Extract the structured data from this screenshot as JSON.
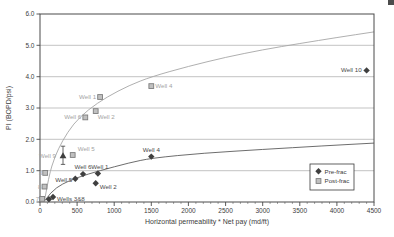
{
  "page": {
    "background": "#ffffff"
  },
  "chart_data": {
    "type": "scatter",
    "title": "",
    "xlabel": "Horizontal permeability * Net pay (md/ft)",
    "ylabel": "PI (BOPD/psi)",
    "xlim": [
      0,
      4500
    ],
    "ylim": [
      0,
      6
    ],
    "grid": "horizontal",
    "xticks": {
      "values": [
        0,
        500,
        1000,
        1500,
        2000,
        2500,
        3000,
        3500,
        4000,
        4500
      ],
      "labels": [
        "0",
        "500",
        "1000",
        "1500",
        "2000",
        "2500",
        "3000",
        "3500",
        "4000",
        "4500"
      ],
      "minor_step": 100
    },
    "yticks": {
      "values": [
        0,
        1,
        2,
        3,
        4,
        5,
        6
      ],
      "labels": [
        "0.0",
        "1.0",
        "2.0",
        "3.0",
        "4.0",
        "5.0",
        "6.0"
      ]
    },
    "colors": {
      "pre_marker": "#3f3f3f",
      "post_fill": "#c0c0c0",
      "post_stroke": "#7d7d7d",
      "trend_pre": "#5c5c5c",
      "trend_post": "#a6a6a6",
      "grid": "#9a9a9a",
      "axis": "#4a4a4a",
      "label_pre": "#4a4a4a",
      "label_post": "#a3a3a3",
      "tick_text": "#3d3d3d"
    },
    "legend": {
      "position": "lower-right",
      "items": [
        {
          "label": "Pre-frac",
          "marker": "diamond"
        },
        {
          "label": "Post-frac",
          "marker": "square"
        }
      ]
    },
    "series": [
      {
        "name": "Pre-frac",
        "marker": "diamond",
        "points": [
          {
            "x": 120,
            "y": 0.09,
            "label": "",
            "anchor": "start",
            "dx": 4,
            "dy": 3
          },
          {
            "x": 175,
            "y": 0.16,
            "label": "Wells 3&8",
            "anchor": "start",
            "dx": 4,
            "dy": 4
          },
          {
            "x": 475,
            "y": 0.74,
            "label": "Well 5",
            "anchor": "end",
            "dx": -3,
            "dy": 3
          },
          {
            "x": 580,
            "y": 0.89,
            "label": "Well 6",
            "anchor": "middle",
            "dx": 0,
            "dy": -5
          },
          {
            "x": 780,
            "y": 0.91,
            "label": "Well 1",
            "anchor": "middle",
            "dx": 2,
            "dy": -5
          },
          {
            "x": 750,
            "y": 0.6,
            "label": "Well 2",
            "anchor": "start",
            "dx": 4,
            "dy": 6
          },
          {
            "x": 1500,
            "y": 1.45,
            "label": "Well 4",
            "anchor": "middle",
            "dx": 0,
            "dy": -5
          },
          {
            "x": 4400,
            "y": 4.2,
            "label": "Well 10",
            "anchor": "end",
            "dx": -5,
            "dy": 2
          }
        ]
      },
      {
        "name": "Post-frac",
        "marker": "square",
        "points": [
          {
            "x": 30,
            "y": 0.1,
            "label": "7",
            "anchor": "end",
            "dx": -3,
            "dy": 2
          },
          {
            "x": 60,
            "y": 0.49,
            "label": "8",
            "anchor": "end",
            "dx": -3,
            "dy": 2
          },
          {
            "x": 70,
            "y": 0.93,
            "label": "3",
            "anchor": "end",
            "dx": -3,
            "dy": 2
          },
          {
            "x": 440,
            "y": 1.5,
            "label": "Well 5",
            "anchor": "start",
            "dx": 5,
            "dy": -4
          },
          {
            "x": 610,
            "y": 2.7,
            "label": "Well 6",
            "anchor": "end",
            "dx": -4,
            "dy": 2
          },
          {
            "x": 750,
            "y": 2.9,
            "label": "Well 2",
            "anchor": "start",
            "dx": 2,
            "dy": 8
          },
          {
            "x": 810,
            "y": 3.35,
            "label": "Well 1",
            "anchor": "end",
            "dx": -4,
            "dy": 2
          },
          {
            "x": 1500,
            "y": 3.7,
            "label": "Well 4",
            "anchor": "start",
            "dx": 4,
            "dy": 2
          }
        ]
      }
    ],
    "error_point": {
      "label": "Well 9",
      "x": 310,
      "y": 1.48,
      "y_lo": 1.2,
      "y_hi": 1.78,
      "marker": "triangle",
      "anchor": "end",
      "dx": -7,
      "dy": 0
    },
    "trends": [
      {
        "series": "Pre-frac",
        "points": [
          [
            55,
            0.02
          ],
          [
            150,
            0.33
          ],
          [
            300,
            0.58
          ],
          [
            500,
            0.78
          ],
          [
            800,
            1.0
          ],
          [
            1200,
            1.25
          ],
          [
            1500,
            1.4
          ],
          [
            2200,
            1.56
          ],
          [
            3000,
            1.68
          ],
          [
            3800,
            1.79
          ],
          [
            4500,
            1.88
          ]
        ]
      },
      {
        "series": "Post-frac",
        "points": [
          [
            62,
            0.05
          ],
          [
            120,
            0.85
          ],
          [
            200,
            1.45
          ],
          [
            300,
            1.95
          ],
          [
            450,
            2.5
          ],
          [
            650,
            2.95
          ],
          [
            900,
            3.35
          ],
          [
            1200,
            3.72
          ],
          [
            1500,
            4.0
          ],
          [
            2000,
            4.33
          ],
          [
            2500,
            4.62
          ],
          [
            3000,
            4.86
          ],
          [
            3500,
            5.06
          ],
          [
            4000,
            5.25
          ],
          [
            4500,
            5.43
          ]
        ]
      }
    ]
  }
}
